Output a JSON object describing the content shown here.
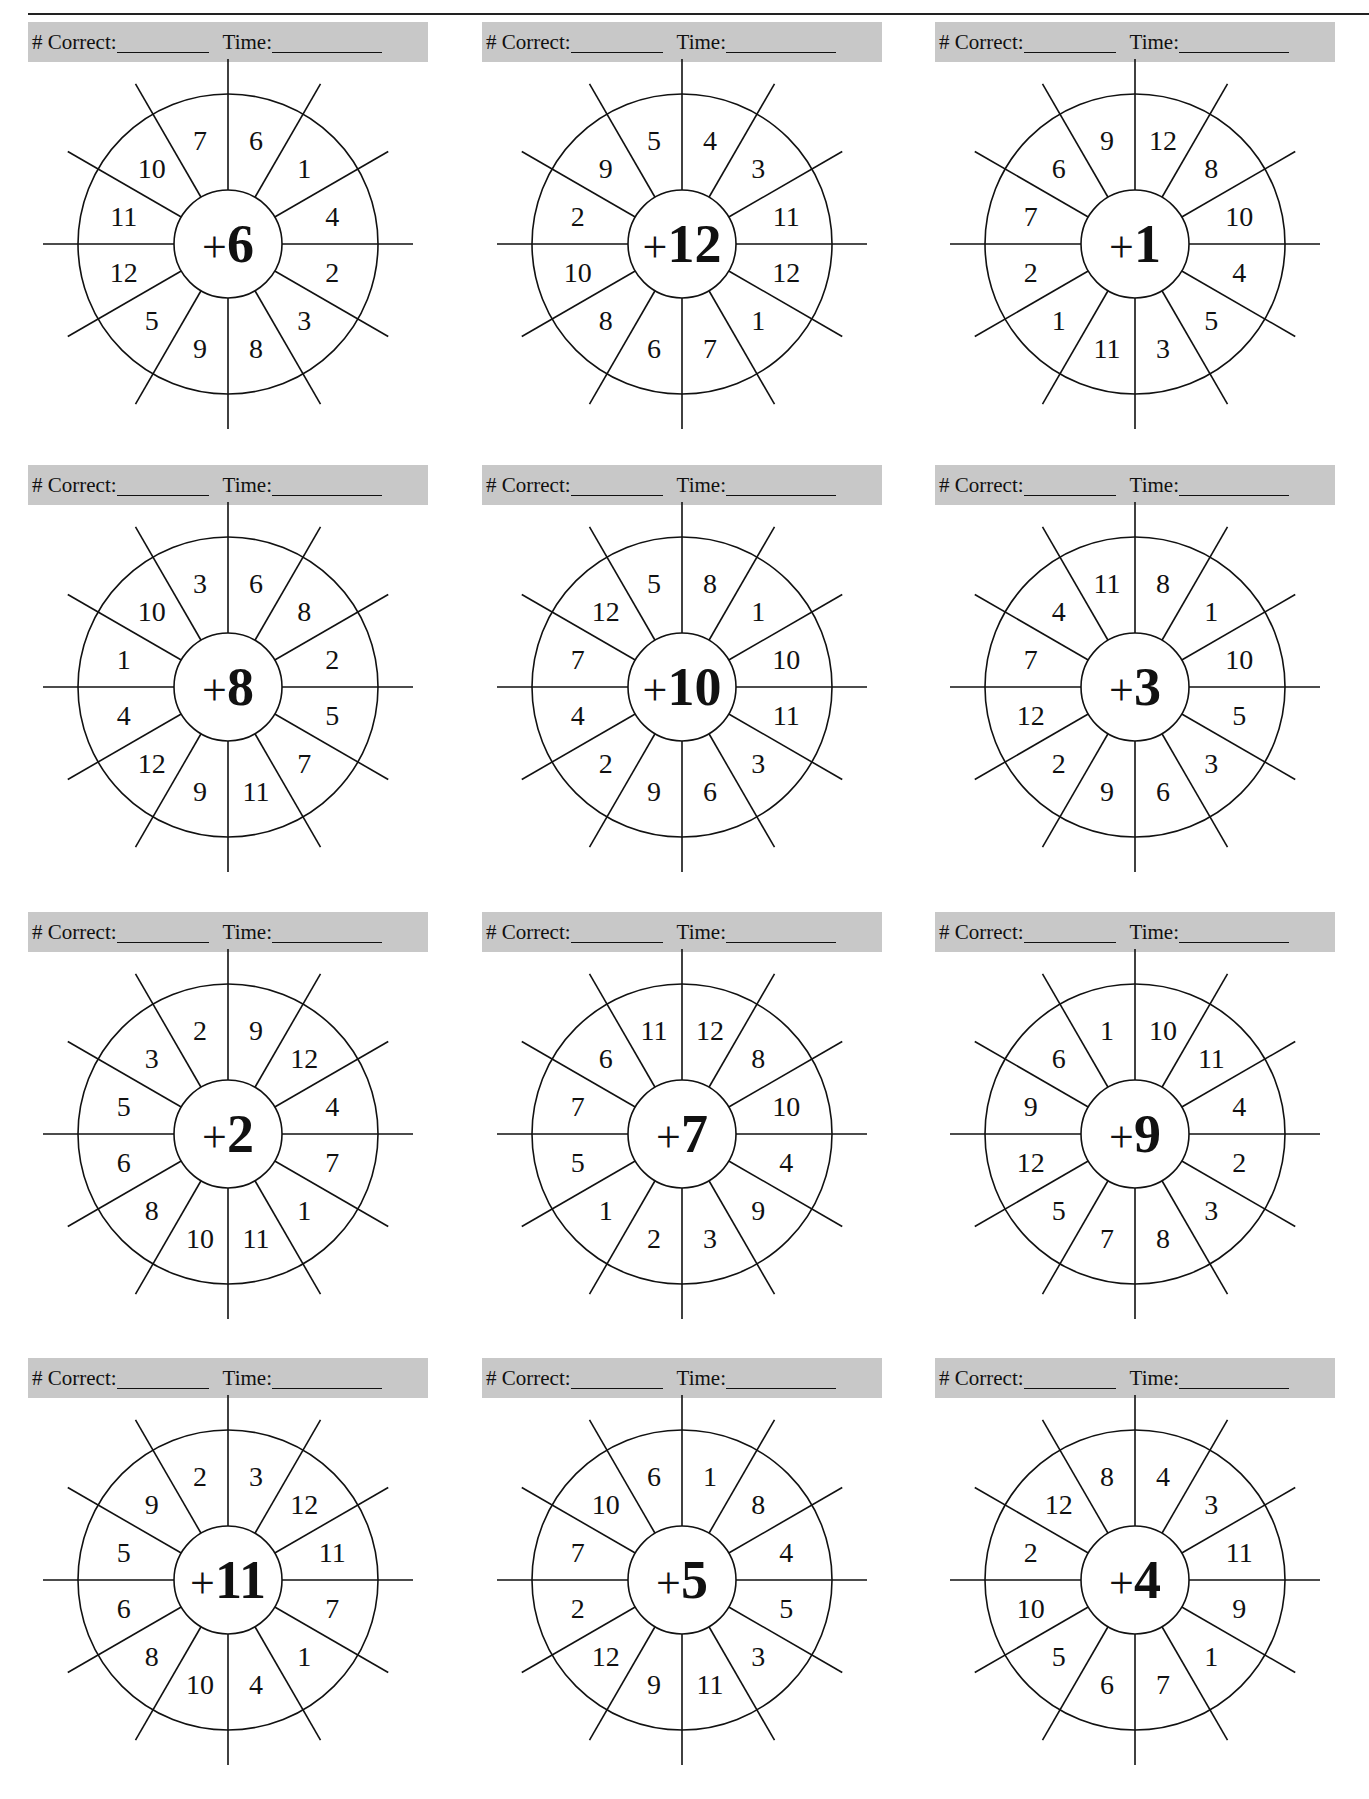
{
  "header_labels": {
    "correct": "# Correct:",
    "time": "Time:"
  },
  "worksheets": [
    {
      "operator": "+",
      "addend": "6",
      "numbers": [
        "6",
        "1",
        "4",
        "2",
        "3",
        "8",
        "9",
        "5",
        "12",
        "11",
        "10",
        "7"
      ]
    },
    {
      "operator": "+",
      "addend": "12",
      "numbers": [
        "4",
        "3",
        "11",
        "12",
        "1",
        "7",
        "6",
        "8",
        "10",
        "2",
        "9",
        "5"
      ]
    },
    {
      "operator": "+",
      "addend": "1",
      "numbers": [
        "12",
        "8",
        "10",
        "4",
        "5",
        "3",
        "11",
        "1",
        "2",
        "7",
        "6",
        "9"
      ]
    },
    {
      "operator": "+",
      "addend": "8",
      "numbers": [
        "6",
        "8",
        "2",
        "5",
        "7",
        "11",
        "9",
        "12",
        "4",
        "1",
        "10",
        "3"
      ]
    },
    {
      "operator": "+",
      "addend": "10",
      "numbers": [
        "8",
        "1",
        "10",
        "11",
        "3",
        "6",
        "9",
        "2",
        "4",
        "7",
        "12",
        "5"
      ]
    },
    {
      "operator": "+",
      "addend": "3",
      "numbers": [
        "8",
        "1",
        "10",
        "5",
        "3",
        "6",
        "9",
        "2",
        "12",
        "7",
        "4",
        "11"
      ]
    },
    {
      "operator": "+",
      "addend": "2",
      "numbers": [
        "9",
        "12",
        "4",
        "7",
        "1",
        "11",
        "10",
        "8",
        "6",
        "5",
        "3",
        "2"
      ]
    },
    {
      "operator": "+",
      "addend": "7",
      "numbers": [
        "12",
        "8",
        "10",
        "4",
        "9",
        "3",
        "2",
        "1",
        "5",
        "7",
        "6",
        "11"
      ]
    },
    {
      "operator": "+",
      "addend": "9",
      "numbers": [
        "10",
        "11",
        "4",
        "2",
        "3",
        "8",
        "7",
        "5",
        "12",
        "9",
        "6",
        "1"
      ]
    },
    {
      "operator": "+",
      "addend": "11",
      "numbers": [
        "3",
        "12",
        "11",
        "7",
        "1",
        "4",
        "10",
        "8",
        "6",
        "5",
        "9",
        "2"
      ]
    },
    {
      "operator": "+",
      "addend": "5",
      "numbers": [
        "1",
        "8",
        "4",
        "5",
        "3",
        "11",
        "9",
        "12",
        "2",
        "7",
        "10",
        "6"
      ]
    },
    {
      "operator": "+",
      "addend": "4",
      "numbers": [
        "4",
        "3",
        "11",
        "9",
        "1",
        "7",
        "6",
        "5",
        "10",
        "2",
        "12",
        "8"
      ]
    }
  ]
}
